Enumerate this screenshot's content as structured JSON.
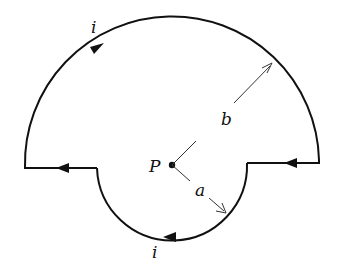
{
  "diagram": {
    "labels": {
      "current_top": "i",
      "current_bottom": "i",
      "point": "P",
      "radius_outer": "b",
      "radius_inner": "a"
    },
    "colors": {
      "stroke": "#111111",
      "radius_lines": "#333333",
      "background": "#ffffff"
    }
  }
}
